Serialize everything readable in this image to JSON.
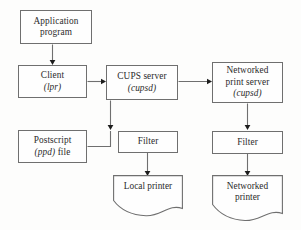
{
  "diagram": {
    "style": {
      "line_color": "#6f6f6f",
      "arrow_color": "#1d1d1d",
      "text_color": "#2b2b2b",
      "background": "#fdfdfc"
    },
    "nodes": [
      {
        "id": "application-program",
        "shape": "rectangle",
        "lines": [
          {
            "text": "Application",
            "italic": false
          },
          {
            "text": "program",
            "italic": false
          }
        ]
      },
      {
        "id": "client",
        "shape": "rectangle",
        "lines": [
          {
            "text": "Client",
            "italic": false
          },
          {
            "text": "(lpr)",
            "italic": true
          }
        ]
      },
      {
        "id": "cups-server",
        "shape": "rectangle",
        "lines": [
          {
            "text": "CUPS server",
            "italic": false
          },
          {
            "text": "(cupsd)",
            "italic": true
          }
        ]
      },
      {
        "id": "networked-print-server",
        "shape": "rectangle",
        "lines": [
          {
            "text": "Networked",
            "italic": false
          },
          {
            "text": "print server",
            "italic": false
          },
          {
            "text": "(cupsd)",
            "italic": true
          }
        ]
      },
      {
        "id": "postscript-ppd-file",
        "shape": "rectangle",
        "lines": [
          {
            "text": "Postscript",
            "italic": false
          },
          {
            "text": "(ppd) file",
            "italic": false
          }
        ]
      },
      {
        "id": "filter-local",
        "shape": "rectangle",
        "lines": [
          {
            "text": "Filter",
            "italic": false
          }
        ]
      },
      {
        "id": "filter-networked",
        "shape": "rectangle",
        "lines": [
          {
            "text": "Filter",
            "italic": false
          }
        ]
      },
      {
        "id": "local-printer",
        "shape": "document",
        "lines": [
          {
            "text": "Local printer",
            "italic": false
          }
        ]
      },
      {
        "id": "networked-printer",
        "shape": "document",
        "lines": [
          {
            "text": "Networked",
            "italic": false
          },
          {
            "text": "printer",
            "italic": false
          }
        ]
      }
    ],
    "edges": [
      {
        "from": "application-program",
        "to": "client",
        "direction": "down"
      },
      {
        "from": "client",
        "to": "cups-server",
        "direction": "right"
      },
      {
        "from": "cups-server",
        "to": "networked-print-server",
        "direction": "right"
      },
      {
        "from": "cups-server",
        "to": "filter-local",
        "direction": "down"
      },
      {
        "from": "postscript-ppd-file",
        "to": "filter-local",
        "direction": "right-up"
      },
      {
        "from": "filter-local",
        "to": "local-printer",
        "direction": "down"
      },
      {
        "from": "networked-print-server",
        "to": "filter-networked",
        "direction": "down"
      },
      {
        "from": "filter-networked",
        "to": "networked-printer",
        "direction": "down"
      }
    ],
    "labels": {
      "application_program_l1": "Application",
      "application_program_l2": "program",
      "client_l1": "Client",
      "client_l2": "(lpr)",
      "cups_server_l1": "CUPS server",
      "cups_server_l2": "(cupsd)",
      "nps_l1": "Networked",
      "nps_l2": "print server",
      "nps_l3": "(cupsd)",
      "postscript_l1": "Postscript",
      "postscript_l2a": "(ppd)",
      "postscript_l2b": " file",
      "filter_local": "Filter",
      "filter_networked": "Filter",
      "local_printer": "Local printer",
      "networked_printer_l1": "Networked",
      "networked_printer_l2": "printer"
    }
  }
}
